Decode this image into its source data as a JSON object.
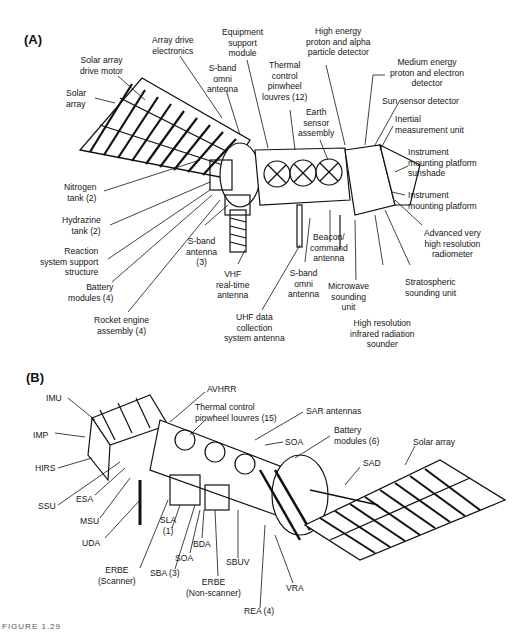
{
  "figure": {
    "caption": "FIGURE 1.29"
  },
  "panel_a": {
    "label": "(A)",
    "labels": {
      "solar_array": "Solar\narray",
      "solar_array_drive_motor": "Solar array\ndrive motor",
      "array_drive_electronics": "Array drive\nelectronics",
      "equipment_support_module": "Equipment\nsupport\nmodule",
      "s_band_omni_antenna_top": "S-band\nomni\nantenna",
      "thermal_control_louvres": "Thermal\ncontrol\npinwheel\nlouvres (12)",
      "high_energy_detector": "High energy\nproton and alpha\nparticle detector",
      "earth_sensor_assembly": "Earth\nsensor\nassembly",
      "medium_energy_detector": "Medium energy\nproton and electron\ndetector",
      "sun_sensor_detector": "Sun sensor detector",
      "inertial_measurement_unit": "Inertial\nmeasurement unit",
      "instrument_platform_sunshade": "Instrument\nmounting platform\nsunshade",
      "instrument_mounting_platform": "Instrument\nmounting platform",
      "avhrr": "Advanced very\nhigh resolution\nradiometer",
      "stratospheric_sounding_unit": "Stratospheric\nsounding unit",
      "hirs": "High resolution\ninfrared radiation\nsounder",
      "microwave_sounding_unit": "Microwave\nsounding\nunit",
      "beacon_command_antenna": "Beacon/\ncommand\nantenna",
      "s_band_omni_antenna_bottom": "S-band\nomni\nantenna",
      "uhf_antenna": "UHF data\ncollection\nsystem antenna",
      "vhf_antenna": "VHF\nreal-time\nantenna",
      "s_band_antenna_3": "S-band\nantenna\n(3)",
      "nitrogen_tank": "Nitrogen\ntank (2)",
      "hydrazine_tank": "Hydrazine\ntank (2)",
      "reaction_support": "Reaction\nsystem support\nstructure",
      "battery_modules_4": "Battery\nmodules (4)",
      "rocket_engine": "Rocket engine\nassembly (4)"
    }
  },
  "panel_b": {
    "label": "(B)",
    "labels": {
      "imu": "IMU",
      "imp": "IMP",
      "hirs": "HIRS",
      "ssu": "SSU",
      "esa": "ESA",
      "msu": "MSU",
      "uda": "UDA",
      "erbe_scanner": "ERBE\n(Scanner)",
      "sla": "SLA\n(1)",
      "sba": "SBA (3)",
      "soa_bottom": "SOA",
      "bda": "BDA",
      "erbe_nonscanner": "ERBE\n(Non-scanner)",
      "sbuv": "SBUV",
      "rea": "REA (4)",
      "vra": "VRA",
      "avhrr": "AVHRR",
      "thermal_louvres": "Thermal control\npinwheel louvres (15)",
      "sar_antennas": "SAR antennas",
      "soa_top": "SOA",
      "battery_modules_6": "Battery\nmodules (6)",
      "sad": "SAD",
      "solar_array": "Solar array"
    }
  }
}
